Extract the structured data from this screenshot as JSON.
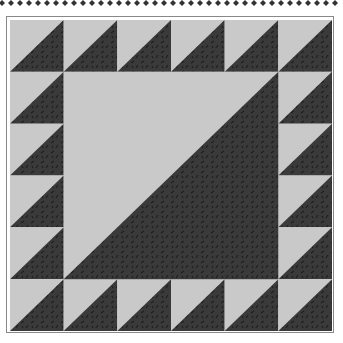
{
  "grid_size": 6,
  "colors": {
    "light": "#c9c9c9",
    "dark": "#3a3a3a",
    "print": "#1e1e1e"
  },
  "center_span": 4
}
